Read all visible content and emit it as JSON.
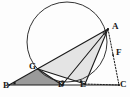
{
  "figure": {
    "kind": "euclidean-geometry-diagram",
    "background_color": "#fdfdfd",
    "stroke_color": "#1a1a1a",
    "circle_stroke_color": "#333333",
    "fill_light": "#e4e4e4",
    "fill_dark": "#9a9a9a",
    "dotted_color": "#1a1a1a",
    "points": [
      {
        "name": "A",
        "label": "A",
        "x": 108,
        "y": 29,
        "label_x": 112,
        "label_y": 22,
        "on_circle": true
      },
      {
        "name": "B",
        "label": "B",
        "x": 9,
        "y": 85,
        "label_x": 3,
        "label_y": 81,
        "on_circle": false
      },
      {
        "name": "C",
        "label": "C",
        "x": 119,
        "y": 85,
        "label_x": 120,
        "label_y": 80,
        "on_circle": false
      },
      {
        "name": "D",
        "label": "D",
        "x": 62,
        "y": 85,
        "label_x": 58,
        "label_y": 80,
        "on_circle": false
      },
      {
        "name": "E",
        "label": "E",
        "x": 85,
        "y": 84,
        "label_x": 80,
        "label_y": 80,
        "on_circle": true
      },
      {
        "name": "F",
        "label": "F",
        "x": 113,
        "y": 55,
        "label_x": 116,
        "label_y": 48,
        "on_circle": false
      },
      {
        "name": "G",
        "label": "G",
        "x": 38,
        "y": 69,
        "label_x": 29,
        "label_y": 62,
        "on_circle": true
      }
    ],
    "circle": {
      "cx": 67,
      "cy": 42,
      "r": 40
    },
    "solid_segments": [
      {
        "name": "segment-B-C",
        "from": "B",
        "to": "C"
      },
      {
        "name": "segment-B-A",
        "from": "B",
        "to": "A"
      },
      {
        "name": "segment-A-E",
        "from": "A",
        "to": "E"
      },
      {
        "name": "segment-A-D",
        "from": "A",
        "to": "D"
      },
      {
        "name": "segment-G-E",
        "from": "G",
        "to": "E"
      },
      {
        "name": "segment-G-D",
        "from": "G",
        "to": "D"
      }
    ],
    "dotted_segments": [
      {
        "name": "segment-A-C",
        "from": "A",
        "to": "C"
      },
      {
        "name": "segment-E-C",
        "from": "E",
        "to": "C"
      }
    ],
    "shaded_regions": [
      {
        "name": "triangle-B-G-D",
        "vertices": [
          "B",
          "G",
          "D"
        ],
        "shade": "dark"
      },
      {
        "name": "triangle-G-A-E",
        "vertices": [
          "G",
          "A",
          "E"
        ],
        "shade": "light"
      }
    ],
    "angle_marks": [
      {
        "name": "angle-mark-B",
        "at": "B"
      },
      {
        "name": "angle-mark-D",
        "at": "D"
      },
      {
        "name": "angle-mark-E",
        "at": "E"
      },
      {
        "name": "angle-mark-A",
        "at": "A"
      }
    ]
  }
}
